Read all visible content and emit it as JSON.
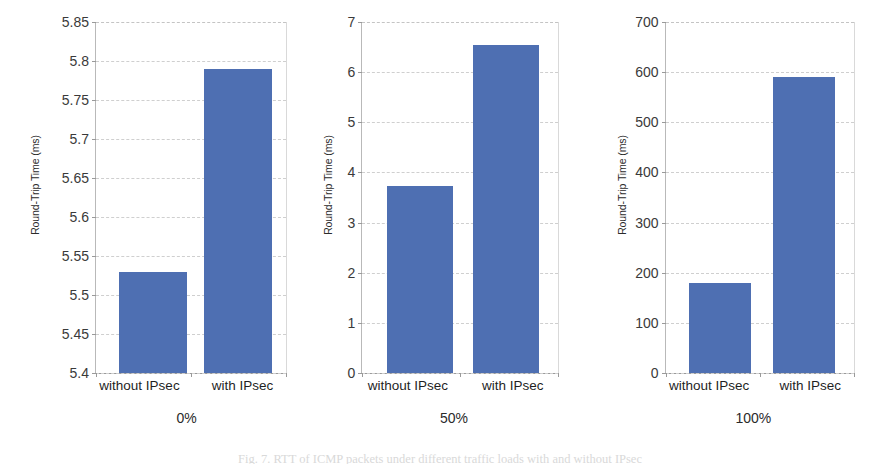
{
  "figure": {
    "caption": "Fig. 7.  RTT of ICMP packets under different traffic loads with and without IPsec",
    "bar_color": "#4e6fb2",
    "grid_color": "#cfcfcf",
    "axis_color": "#9a9a9a"
  },
  "chart_data": [
    {
      "type": "bar",
      "title": "0%",
      "xlabel": "",
      "ylabel": "Round-Trip Time (ms)",
      "categories": [
        "without IPsec",
        "with IPsec"
      ],
      "values": [
        5.53,
        5.79
      ],
      "ylim": [
        5.4,
        5.85
      ],
      "yticks": [
        "5.4",
        "5.45",
        "5.5",
        "5.55",
        "5.6",
        "5.65",
        "5.7",
        "5.75",
        "5.8",
        "5.85"
      ],
      "ytick_values": [
        5.4,
        5.45,
        5.5,
        5.55,
        5.6,
        5.65,
        5.7,
        5.75,
        5.8,
        5.85
      ],
      "grid": true,
      "legend": "none"
    },
    {
      "type": "bar",
      "title": "50%",
      "xlabel": "",
      "ylabel": "Round-Trip Time (ms)",
      "categories": [
        "without IPsec",
        "with IPsec"
      ],
      "values": [
        3.73,
        6.55
      ],
      "ylim": [
        0,
        7
      ],
      "yticks": [
        "0",
        "1",
        "2",
        "3",
        "4",
        "5",
        "6",
        "7"
      ],
      "ytick_values": [
        0,
        1,
        2,
        3,
        4,
        5,
        6,
        7
      ],
      "grid": true,
      "legend": "none"
    },
    {
      "type": "bar",
      "title": "100%",
      "xlabel": "",
      "ylabel": "Round-Trip Time (ms)",
      "categories": [
        "without IPsec",
        "with IPsec"
      ],
      "values": [
        180,
        590
      ],
      "ylim": [
        0,
        700
      ],
      "yticks": [
        "0",
        "100",
        "200",
        "300",
        "400",
        "500",
        "600",
        "700"
      ],
      "ytick_values": [
        0,
        100,
        200,
        300,
        400,
        500,
        600,
        700
      ],
      "grid": true,
      "legend": "none"
    }
  ]
}
